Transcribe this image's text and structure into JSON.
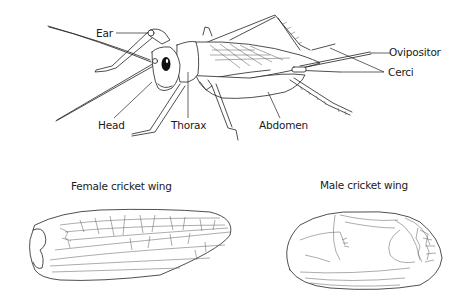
{
  "diagram": {
    "body_labels": [
      {
        "id": "ear",
        "text": "Ear"
      },
      {
        "id": "head",
        "text": "Head"
      },
      {
        "id": "thorax",
        "text": "Thorax"
      },
      {
        "id": "abdomen",
        "text": "Abdomen"
      },
      {
        "id": "ovipositor",
        "text": "Ovipositor"
      },
      {
        "id": "cerci",
        "text": "Cerci"
      }
    ],
    "wings": [
      {
        "id": "female",
        "title": "Female cricket wing"
      },
      {
        "id": "male",
        "title": "Male cricket wing"
      }
    ]
  },
  "colors": {
    "line": "#222222",
    "vein": "#666666",
    "background": "#ffffff",
    "eye": "#111111"
  }
}
